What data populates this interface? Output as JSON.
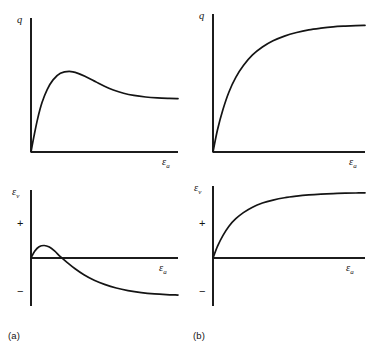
{
  "figure": {
    "panels": [
      {
        "id": "a-q",
        "caption_group": "(a)",
        "y_axis_label_main": "q",
        "y_axis_label_sub": "",
        "x_axis_label_main": "ε",
        "x_axis_label_sub": "a",
        "pos_sign": "",
        "neg_sign": ""
      },
      {
        "id": "a-ev",
        "caption_group": "(a)",
        "y_axis_label_main": "ε",
        "y_axis_label_sub": "v",
        "x_axis_label_main": "ε",
        "x_axis_label_sub": "a",
        "pos_sign": "+",
        "neg_sign": "−"
      },
      {
        "id": "b-q",
        "caption_group": "(b)",
        "y_axis_label_main": "q",
        "y_axis_label_sub": "",
        "x_axis_label_main": "ε",
        "x_axis_label_sub": "a",
        "pos_sign": "",
        "neg_sign": ""
      },
      {
        "id": "b-ev",
        "caption_group": "(b)",
        "y_axis_label_main": "ε",
        "y_axis_label_sub": "v",
        "x_axis_label_main": "ε",
        "x_axis_label_sub": "a",
        "pos_sign": "+",
        "neg_sign": "−"
      }
    ],
    "captions": [
      {
        "id": "caption-a",
        "text": "(a)"
      },
      {
        "id": "caption-b",
        "text": "(b)"
      }
    ],
    "colors": {
      "curve": "#141414",
      "axis": "#1c1c1c",
      "background": "#ffffff"
    }
  },
  "chart_data": [
    {
      "type": "line",
      "id": "a-q",
      "title": "",
      "xlabel": "εa",
      "ylabel": "q",
      "description": "Deviator stress versus axial strain for dense / overconsolidated soil: rises steeply to a peak then strain-softens to a lower residual plateau.",
      "xlim": [
        0,
        1
      ],
      "ylim": [
        0,
        1
      ],
      "grid": false,
      "legend": null,
      "zero_line": false,
      "series": [
        {
          "name": "q-dense",
          "x": [
            0.0,
            0.02,
            0.045,
            0.075,
            0.11,
            0.15,
            0.2,
            0.26,
            0.32,
            0.38,
            0.44,
            0.5,
            0.56,
            0.63,
            0.7,
            0.78,
            0.86,
            0.94,
            1.0
          ],
          "y": [
            0.0,
            0.12,
            0.255,
            0.38,
            0.48,
            0.555,
            0.605,
            0.62,
            0.605,
            0.575,
            0.54,
            0.505,
            0.477,
            0.452,
            0.435,
            0.423,
            0.416,
            0.412,
            0.41
          ]
        }
      ],
      "annotations": [
        {
          "text": "peak",
          "x": 0.26,
          "y": 0.62
        },
        {
          "text": "residual plateau",
          "x": 1.0,
          "y": 0.41
        }
      ]
    },
    {
      "type": "line",
      "id": "a-ev",
      "title": "",
      "xlabel": "εa",
      "ylabel": "εv",
      "description": "Volumetric strain versus axial strain for dense / overconsolidated soil: small initial contraction hump (positive) followed by continuing dilation (negative).",
      "xlim": [
        0,
        1
      ],
      "ylim": [
        -1,
        1
      ],
      "grid": false,
      "legend": null,
      "zero_line": true,
      "axis_sign_labels": {
        "positive": "+",
        "negative": "−"
      },
      "series": [
        {
          "name": "ev-dense",
          "x": [
            0.0,
            0.025,
            0.055,
            0.09,
            0.125,
            0.16,
            0.2,
            0.245,
            0.3,
            0.36,
            0.43,
            0.5,
            0.58,
            0.66,
            0.75,
            0.84,
            0.92,
            1.0
          ],
          "y": [
            0.0,
            0.105,
            0.175,
            0.195,
            0.17,
            0.11,
            0.02,
            -0.09,
            -0.225,
            -0.35,
            -0.465,
            -0.55,
            -0.625,
            -0.678,
            -0.72,
            -0.748,
            -0.763,
            -0.772
          ]
        }
      ],
      "annotations": [
        {
          "text": "contraction hump",
          "x": 0.09,
          "y": 0.195
        },
        {
          "text": "dilation",
          "x": 1.0,
          "y": -0.772
        }
      ]
    },
    {
      "type": "line",
      "id": "b-q",
      "title": "",
      "xlabel": "εa",
      "ylabel": "q",
      "description": "Deviator stress versus axial strain for loose / normally consolidated soil: monotonic hardening approaching a horizontal asymptote, no peak.",
      "xlim": [
        0,
        1
      ],
      "ylim": [
        0,
        1
      ],
      "grid": false,
      "legend": null,
      "zero_line": false,
      "series": [
        {
          "name": "q-loose",
          "x": [
            0.0,
            0.03,
            0.065,
            0.105,
            0.15,
            0.2,
            0.26,
            0.325,
            0.395,
            0.47,
            0.55,
            0.63,
            0.71,
            0.79,
            0.87,
            0.94,
            1.0
          ],
          "y": [
            0.0,
            0.17,
            0.32,
            0.455,
            0.565,
            0.655,
            0.735,
            0.795,
            0.842,
            0.878,
            0.905,
            0.925,
            0.938,
            0.948,
            0.954,
            0.958,
            0.96
          ]
        }
      ],
      "annotations": [
        {
          "text": "asymptote",
          "x": 1.0,
          "y": 0.96
        }
      ]
    },
    {
      "type": "line",
      "id": "b-ev",
      "title": "",
      "xlabel": "εa",
      "ylabel": "εv",
      "description": "Volumetric strain versus axial strain for loose / normally consolidated soil: monotonic contraction (entirely positive) levelling off to a plateau, no dilation.",
      "xlim": [
        0,
        1
      ],
      "ylim": [
        -1,
        1
      ],
      "grid": false,
      "legend": null,
      "zero_line": true,
      "axis_sign_labels": {
        "positive": "+",
        "negative": "−"
      },
      "series": [
        {
          "name": "ev-loose",
          "x": [
            0.0,
            0.03,
            0.065,
            0.105,
            0.15,
            0.2,
            0.26,
            0.325,
            0.395,
            0.47,
            0.55,
            0.63,
            0.71,
            0.79,
            0.87,
            0.94,
            1.0
          ],
          "y": [
            0.0,
            0.175,
            0.33,
            0.468,
            0.578,
            0.668,
            0.748,
            0.808,
            0.852,
            0.886,
            0.91,
            0.928,
            0.94,
            0.948,
            0.953,
            0.956,
            0.958
          ]
        }
      ],
      "annotations": [
        {
          "text": "contraction plateau",
          "x": 1.0,
          "y": 0.958
        }
      ]
    }
  ]
}
